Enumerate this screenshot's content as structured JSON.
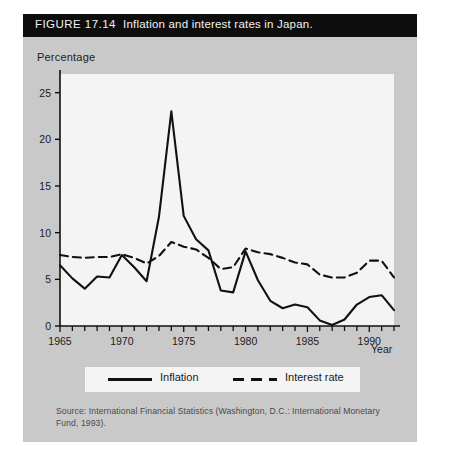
{
  "figure": {
    "number": "FIGURE 17.14",
    "caption": "Inflation and interest rates in Japan."
  },
  "axis": {
    "y_title": "Percentage",
    "x_title": "Year"
  },
  "legend": {
    "inflation_label": "Inflation",
    "interest_label": "Interest rate"
  },
  "source": "Source: International Financial Statistics (Washington, D.C.: International Monetary Fund, 1993).",
  "colors": {
    "title_bar": "#0d0d0d",
    "card_background": "#c9c9c9",
    "plot_background": "#f4f4f4",
    "line": "#111111",
    "text": "#1b1b1b"
  },
  "chart_data": {
    "type": "line",
    "title": "Inflation and interest rates in Japan.",
    "xlabel": "Year",
    "ylabel": "Percentage",
    "xlim": [
      1965,
      1992
    ],
    "ylim": [
      0,
      27
    ],
    "yticks": [
      0,
      5,
      10,
      15,
      20,
      25
    ],
    "ytick_labels": [
      "0",
      "5",
      "10",
      "15",
      "20",
      "25"
    ],
    "xticks": [
      1965,
      1970,
      1975,
      1980,
      1985,
      1990
    ],
    "xtick_labels": [
      "1965",
      "1970",
      "1975",
      "1980",
      "1985",
      "1990"
    ],
    "minor_xticks_every": 1,
    "grid": false,
    "legend_position": "below-plot",
    "x": [
      1965,
      1966,
      1967,
      1968,
      1969,
      1970,
      1971,
      1972,
      1973,
      1974,
      1975,
      1976,
      1977,
      1978,
      1979,
      1980,
      1981,
      1982,
      1983,
      1984,
      1985,
      1986,
      1987,
      1988,
      1989,
      1990,
      1991,
      1992
    ],
    "series": [
      {
        "name": "Inflation",
        "style": "solid",
        "values": [
          6.5,
          5.1,
          4.0,
          5.3,
          5.2,
          7.6,
          6.3,
          4.8,
          11.7,
          23.0,
          11.8,
          9.3,
          8.1,
          3.8,
          3.6,
          8.0,
          4.9,
          2.7,
          1.9,
          2.3,
          2.0,
          0.6,
          0.1,
          0.7,
          2.3,
          3.1,
          3.3,
          1.7
        ]
      },
      {
        "name": "Interest rate",
        "style": "dashed",
        "values": [
          7.6,
          7.4,
          7.3,
          7.4,
          7.4,
          7.7,
          7.3,
          6.7,
          7.5,
          9.0,
          8.5,
          8.2,
          7.3,
          6.1,
          6.3,
          8.3,
          7.9,
          7.7,
          7.3,
          6.8,
          6.6,
          5.5,
          5.2,
          5.2,
          5.7,
          7.0,
          7.0,
          5.2
        ]
      }
    ],
    "annotations": [
      {
        "text": "Peak inflation 1974",
        "x": 1974,
        "y": 23.0
      }
    ]
  }
}
